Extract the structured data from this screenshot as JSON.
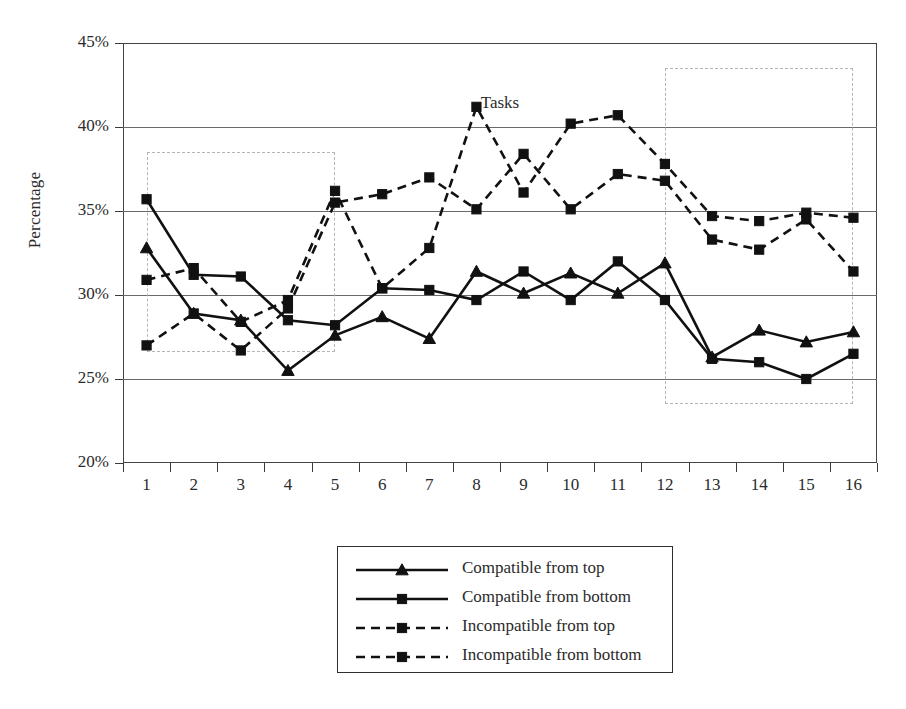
{
  "chart_data": {
    "type": "line",
    "title": "",
    "xlabel": "Tasks",
    "ylabel": "Percentage",
    "categories": [
      "1",
      "2",
      "3",
      "4",
      "5",
      "6",
      "7",
      "8",
      "9",
      "10",
      "11",
      "12",
      "13",
      "14",
      "15",
      "16"
    ],
    "ytick_labels": [
      "45%",
      "40%",
      "35%",
      "30%",
      "25%",
      "20%"
    ],
    "ytick_values": [
      45,
      40,
      35,
      30,
      25,
      20
    ],
    "ylim": [
      20,
      45
    ],
    "grid": true,
    "legend_position": "bottom-center",
    "series": [
      {
        "name": "Compatible from top",
        "style": "solid",
        "marker": "triangle",
        "values": [
          32.8,
          28.9,
          28.5,
          25.5,
          27.6,
          28.7,
          27.4,
          31.4,
          30.1,
          31.3,
          30.1,
          31.9,
          26.3,
          27.9,
          27.2,
          27.8
        ]
      },
      {
        "name": "Compatible from bottom",
        "style": "solid",
        "marker": "square",
        "values": [
          35.7,
          31.2,
          31.1,
          28.5,
          28.2,
          30.4,
          30.3,
          29.7,
          31.4,
          29.7,
          32.0,
          29.7,
          26.2,
          26.0,
          25.0,
          26.5
        ]
      },
      {
        "name": "Incompatible from top",
        "style": "dashed",
        "marker": "square",
        "values": [
          30.9,
          31.6,
          28.4,
          29.7,
          36.2,
          30.4,
          32.8,
          41.2,
          36.1,
          40.2,
          40.7,
          37.8,
          34.7,
          34.4,
          34.9,
          34.6
        ]
      },
      {
        "name": "Incompatible from bottom",
        "style": "dashed",
        "marker": "square",
        "values": [
          27.0,
          28.9,
          26.7,
          29.2,
          35.5,
          36.0,
          37.0,
          35.1,
          38.4,
          35.1,
          37.2,
          36.8,
          33.3,
          32.7,
          34.5,
          31.4
        ]
      }
    ],
    "annotations": [
      {
        "name": "highlight-box-left",
        "type": "dashed-rectangle",
        "x_range": [
          1,
          5
        ],
        "y_range": [
          26.6,
          38.5
        ]
      },
      {
        "name": "highlight-box-right",
        "type": "dashed-rectangle",
        "x_range": [
          12,
          16
        ],
        "y_range": [
          23.5,
          43.5
        ]
      }
    ],
    "colors": {
      "line": "#111111",
      "grid": "#6a6a6a",
      "axis": "#444444",
      "highlight": "#b5b5b5"
    }
  }
}
